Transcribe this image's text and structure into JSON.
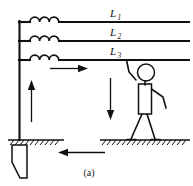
{
  "figure": {
    "caption": "(a)"
  },
  "lines": [
    {
      "id": "L1",
      "label": "L",
      "subscript": "1",
      "y": 22
    },
    {
      "id": "L2",
      "label": "L",
      "subscript": "2",
      "y": 41
    },
    {
      "id": "L3",
      "label": "L",
      "subscript": "3",
      "y": 60
    }
  ],
  "arrows": [
    {
      "name": "current-arrow-upper-right",
      "direction": "right"
    },
    {
      "name": "current-arrow-left-vertical",
      "direction": "up"
    },
    {
      "name": "current-arrow-person-down",
      "direction": "down"
    },
    {
      "name": "current-arrow-ground-return",
      "direction": "left"
    }
  ],
  "components": {
    "coil_count": 3,
    "coil_name": "inductor-coil",
    "bus_name": "vertical-bus-conductor",
    "electrode_name": "grounding-electrode",
    "person_name": "person-figure",
    "ground_left_name": "ground-surface-left",
    "ground_right_name": "ground-surface-right"
  },
  "colors": {
    "ink": "#101010",
    "background": "#ffffff"
  }
}
